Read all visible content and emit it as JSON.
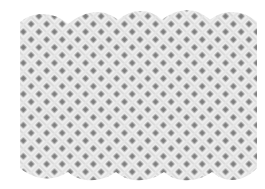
{
  "image": {
    "subject": "white lattice trellis panel",
    "shape": "rectangular panel with scalloped top and bottom edges",
    "colors": {
      "background": "#ffffff",
      "lattice_slats": "#f2f2f2",
      "slat_shadow": "#d9d9d9",
      "holes": "#8c8c8c"
    },
    "scallops_top": 4,
    "scallops_bottom": 4
  }
}
